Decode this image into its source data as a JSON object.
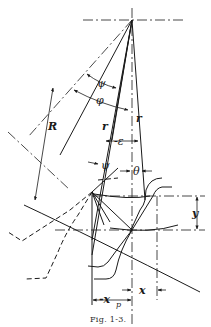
{
  "figure": {
    "caption": "Fig. 1-3.",
    "labels": {
      "psi_top": "ψ",
      "phi": "φ",
      "R": "R",
      "r_left": "r",
      "r_right": "r",
      "epsilon": "-ε",
      "psi_lower": "ψ",
      "theta": "θ",
      "y": "y",
      "x": "x",
      "x_p": "-x",
      "x_p_sub": "p"
    }
  }
}
